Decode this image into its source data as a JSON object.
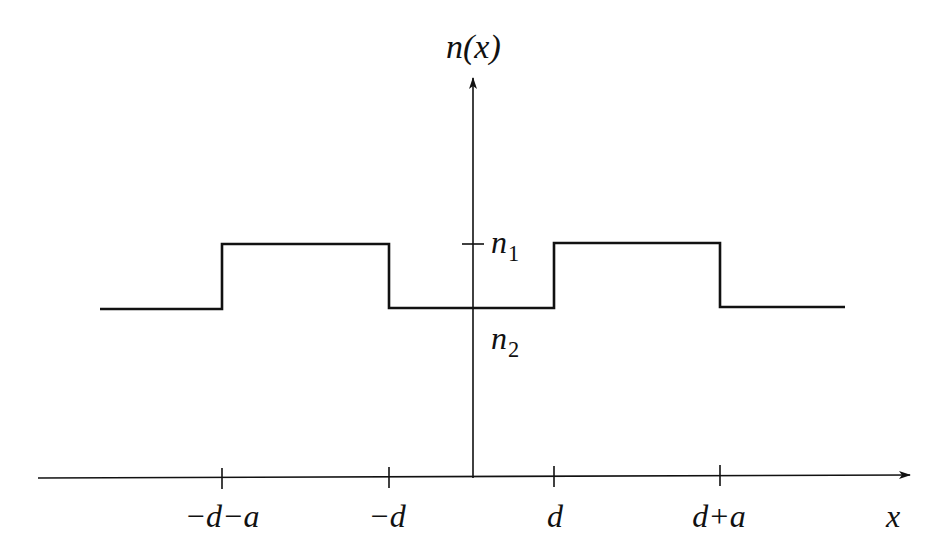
{
  "diagram": {
    "type": "step-profile",
    "y_axis": {
      "label_main": "n(x)"
    },
    "x_axis": {
      "label": "x"
    },
    "levels": {
      "high": {
        "symbol": "n",
        "subscript": "1"
      },
      "low": {
        "symbol": "n",
        "subscript": "2"
      }
    },
    "ticks": [
      {
        "label": "−d−a",
        "x": 222
      },
      {
        "label": "−d",
        "x": 389
      },
      {
        "label": "d",
        "x": 554
      },
      {
        "label": "d+a",
        "x": 720
      }
    ],
    "profile_segments": [
      {
        "from": "-inf",
        "to": "-d-a",
        "value": "n2"
      },
      {
        "from": "-d-a",
        "to": "-d",
        "value": "n1"
      },
      {
        "from": "-d",
        "to": "d",
        "value": "n2"
      },
      {
        "from": "d",
        "to": "d+a",
        "value": "n1"
      },
      {
        "from": "d+a",
        "to": "inf",
        "value": "n2"
      }
    ],
    "colors": {
      "line": "#111111",
      "background": "#ffffff"
    }
  }
}
